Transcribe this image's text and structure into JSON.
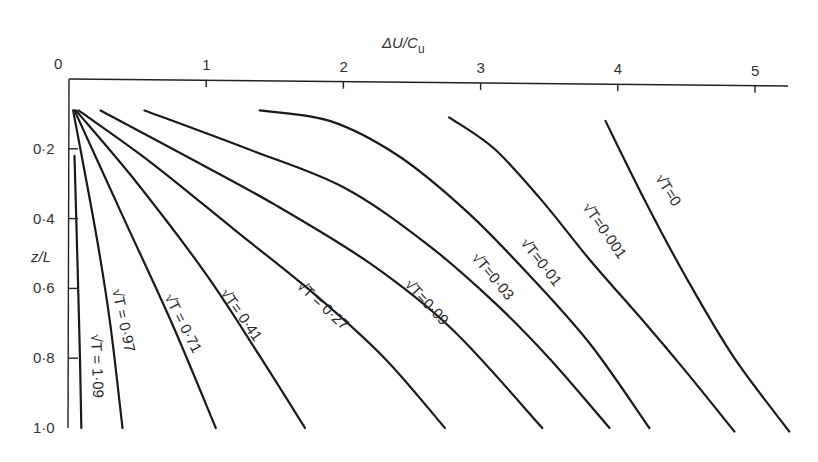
{
  "chart_data": {
    "type": "line",
    "title": "",
    "xlabel": "ΔU/C_u",
    "xlabel_main": "ΔU/C",
    "xlabel_sub": "u",
    "ylabel": "z/L",
    "xlim": [
      0,
      5.25
    ],
    "ylim": [
      1.0,
      0
    ],
    "y_inverted": true,
    "x_axis_position": "top",
    "grid": false,
    "legend": "inline labels along curves",
    "x_ticks": [
      {
        "value": 0,
        "label": "0"
      },
      {
        "value": 1,
        "label": "1"
      },
      {
        "value": 2,
        "label": "2"
      },
      {
        "value": 3,
        "label": "3"
      },
      {
        "value": 4,
        "label": "4"
      },
      {
        "value": 5,
        "label": "5"
      }
    ],
    "y_ticks": [
      {
        "value": 0.2,
        "label": "0·2"
      },
      {
        "value": 0.4,
        "label": "0·4"
      },
      {
        "value": 0.6,
        "label": "0·6"
      },
      {
        "value": 0.8,
        "label": "0·8"
      },
      {
        "value": 1.0,
        "label": "1·0"
      }
    ],
    "series": [
      {
        "name": "√T = 0",
        "label": "√T=0",
        "points": [
          [
            3.91,
            0.12
          ],
          [
            4.2,
            0.35
          ],
          [
            4.5,
            0.57
          ],
          [
            4.85,
            0.8
          ],
          [
            5.25,
            1.01
          ]
        ]
      },
      {
        "name": "√T = 0.001",
        "label": "√T=0·001",
        "points": [
          [
            2.77,
            0.11
          ],
          [
            3.1,
            0.2
          ],
          [
            3.45,
            0.35
          ],
          [
            3.8,
            0.52
          ],
          [
            4.2,
            0.7
          ],
          [
            4.5,
            0.84
          ],
          [
            4.85,
            1.01
          ]
        ]
      },
      {
        "name": "√T = 0.01",
        "label": "√T=0·01",
        "points": [
          [
            1.39,
            0.09
          ],
          [
            1.9,
            0.12
          ],
          [
            2.4,
            0.22
          ],
          [
            2.9,
            0.38
          ],
          [
            3.35,
            0.56
          ],
          [
            3.8,
            0.76
          ],
          [
            4.23,
            1.0
          ]
        ]
      },
      {
        "name": "√T = 0.03",
        "label": "√T=0·03",
        "points": [
          [
            0.55,
            0.09
          ],
          [
            1.3,
            0.2
          ],
          [
            2.0,
            0.31
          ],
          [
            2.6,
            0.47
          ],
          [
            3.1,
            0.64
          ],
          [
            3.5,
            0.8
          ],
          [
            3.94,
            1.0
          ]
        ]
      },
      {
        "name": "√T = 0.09",
        "label": "√T=0·09",
        "points": [
          [
            0.23,
            0.09
          ],
          [
            0.8,
            0.21
          ],
          [
            1.5,
            0.36
          ],
          [
            2.2,
            0.53
          ],
          [
            2.8,
            0.72
          ],
          [
            3.45,
            1.0
          ]
        ]
      },
      {
        "name": "√T = 0.27",
        "label": "√T = 0·27",
        "points": [
          [
            0.07,
            0.09
          ],
          [
            0.6,
            0.24
          ],
          [
            1.2,
            0.43
          ],
          [
            1.8,
            0.62
          ],
          [
            2.3,
            0.8
          ],
          [
            2.74,
            1.0
          ]
        ]
      },
      {
        "name": "√T = 0.41",
        "label": "√T= 0·41",
        "points": [
          [
            0.05,
            0.09
          ],
          [
            0.5,
            0.3
          ],
          [
            1.0,
            0.56
          ],
          [
            1.4,
            0.8
          ],
          [
            1.72,
            1.0
          ]
        ]
      },
      {
        "name": "√T = 0.71",
        "label": "√T = 0·71",
        "points": [
          [
            0.04,
            0.09
          ],
          [
            0.4,
            0.4
          ],
          [
            0.75,
            0.7
          ],
          [
            1.07,
            1.0
          ]
        ]
      },
      {
        "name": "√T = 0.97",
        "label": "√T = 0·97",
        "points": [
          [
            0.03,
            0.09
          ],
          [
            0.2,
            0.45
          ],
          [
            0.3,
            0.7
          ],
          [
            0.39,
            1.0
          ]
        ]
      },
      {
        "name": "√T = 1.09",
        "label": "√T = 1·09",
        "points": [
          [
            0.04,
            0.22
          ],
          [
            0.06,
            0.5
          ],
          [
            0.08,
            0.8
          ],
          [
            0.09,
            1.0
          ]
        ]
      }
    ]
  },
  "labels": {
    "x_axis_main": "ΔU/C",
    "x_axis_sub": "u",
    "y_axis": "z/L",
    "curves": [
      "√T=0",
      "√T=0·001",
      "√T=0·01",
      "√T=0·03",
      "√T=0·09",
      "√T = 0·27",
      "√T= 0·41",
      "√T = 0·71",
      "√T = 0·97",
      "√T = 1·09"
    ]
  }
}
